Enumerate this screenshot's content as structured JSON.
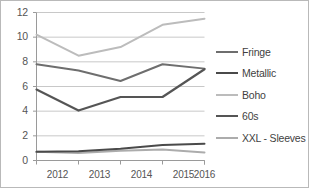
{
  "chart_data": {
    "type": "line",
    "title": "",
    "xlabel": "",
    "ylabel": "",
    "categories": [
      "2012",
      "2013",
      "2014",
      "2015",
      "2016"
    ],
    "x": [
      2012,
      2013,
      2014,
      2015,
      2016
    ],
    "ylim": [
      0,
      12
    ],
    "xlim": [
      2012,
      2016
    ],
    "y_ticks": [
      "0",
      "2",
      "4",
      "6",
      "8",
      "10",
      "12"
    ],
    "y_tick_values": [
      0,
      2,
      4,
      6,
      8,
      10,
      12
    ],
    "grid": "horizontal",
    "legend_position": "right",
    "series": [
      {
        "name": "Fringe",
        "color": "#6e6e6e",
        "width": 2.0,
        "values": [
          7.8,
          7.3,
          6.45,
          7.8,
          7.45
        ]
      },
      {
        "name": "Metallic",
        "color": "#4a4a4a",
        "width": 2.0,
        "values": [
          0.7,
          0.75,
          0.95,
          1.25,
          1.35
        ]
      },
      {
        "name": "Boho",
        "color": "#bcbcbc",
        "width": 2.0,
        "values": [
          10.2,
          8.5,
          9.2,
          11.0,
          11.5
        ]
      },
      {
        "name": "60s",
        "color": "#555555",
        "width": 2.2,
        "values": [
          5.75,
          4.05,
          5.15,
          5.15,
          7.4
        ]
      },
      {
        "name": "XXL - Sleeves",
        "color": "#acacac",
        "width": 2.0,
        "values": [
          0.7,
          0.6,
          0.8,
          0.9,
          0.65
        ]
      }
    ],
    "colors": {
      "grid": "#c8c8c8",
      "axis": "#9a9a9a",
      "text": "#555555",
      "background": "#ffffff",
      "frame": "#b9b9b9"
    }
  }
}
